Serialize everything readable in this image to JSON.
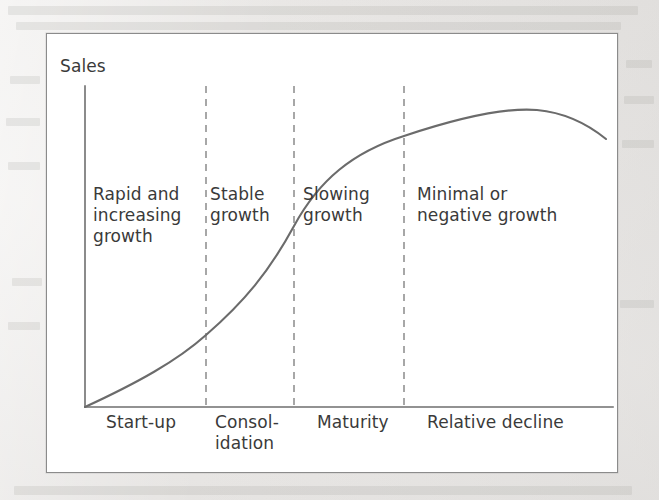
{
  "figure": {
    "y_axis_label": "Sales",
    "colors": {
      "page_background": "#ecebe9",
      "figure_background": "#ffffff",
      "frame_border": "#8b8b8b",
      "axis_line": "#6e6e6e",
      "curve": "#6b6b6b",
      "divider_dashed": "#8a8a8a",
      "text": "#3a3a3a"
    },
    "zone_labels": [
      {
        "id": "rapid-increasing-growth",
        "text": "Rapid and\nincreasing\ngrowth",
        "x": 46,
        "y": 150
      },
      {
        "id": "stable-growth",
        "text": "Stable\ngrowth",
        "x": 163,
        "y": 150
      },
      {
        "id": "slowing-growth",
        "text": "Slowing\ngrowth",
        "x": 256,
        "y": 150
      },
      {
        "id": "minimal-negative-growth",
        "text": "Minimal or\nnegative growth",
        "x": 370,
        "y": 150
      }
    ],
    "stage_labels": [
      {
        "id": "start-up",
        "text": "Start-up",
        "x": 59,
        "y": 378
      },
      {
        "id": "consolidation",
        "text": "Consol-\nidation",
        "x": 168,
        "y": 378
      },
      {
        "id": "maturity",
        "text": "Maturity",
        "x": 270,
        "y": 378
      },
      {
        "id": "relative-decline",
        "text": "Relative decline",
        "x": 380,
        "y": 378
      }
    ]
  },
  "chart_data": {
    "type": "line",
    "title": "",
    "xlabel": "",
    "ylabel": "Sales",
    "grid": false,
    "legend": null,
    "axis": {
      "y_axis_x": 38,
      "y_axis_top": 52,
      "y_axis_bottom": 373,
      "x_axis_y": 373,
      "x_axis_left": 38,
      "x_axis_right": 566
    },
    "dividers": [
      {
        "id": "divider-startup-consolidation",
        "x": 159
      },
      {
        "id": "divider-consolidation-maturity",
        "x": 247
      },
      {
        "id": "divider-maturity-decline",
        "x": 357
      }
    ],
    "categories": [
      "Start-up",
      "Consolidation",
      "Maturity",
      "Relative decline"
    ],
    "growth_phases": [
      "Rapid and increasing growth",
      "Stable growth",
      "Slowing growth",
      "Minimal or negative growth"
    ],
    "curve_points": [
      {
        "x": 38,
        "y": 373
      },
      {
        "x": 80,
        "y": 352
      },
      {
        "x": 120,
        "y": 330
      },
      {
        "x": 159,
        "y": 301
      },
      {
        "x": 200,
        "y": 268
      },
      {
        "x": 247,
        "y": 192
      },
      {
        "x": 290,
        "y": 147
      },
      {
        "x": 330,
        "y": 117
      },
      {
        "x": 357,
        "y": 102
      },
      {
        "x": 400,
        "y": 84
      },
      {
        "x": 444,
        "y": 75
      },
      {
        "x": 490,
        "y": 76
      },
      {
        "x": 530,
        "y": 88
      },
      {
        "x": 559,
        "y": 105
      }
    ],
    "curve_path": "M 38 373 C 90 349 130 327 159 301 C 197 268 222 238 247 192 C 272 146 306 118 357 102 C 405 86 455 73 490 76 C 522 79 543 92 559 105",
    "annotations": {
      "shape": "S-curve / sigmoid rising then peaking and declining",
      "peak_x": 470,
      "peak_y": 74,
      "inflection_x": 247,
      "inflection_y": 192
    }
  }
}
